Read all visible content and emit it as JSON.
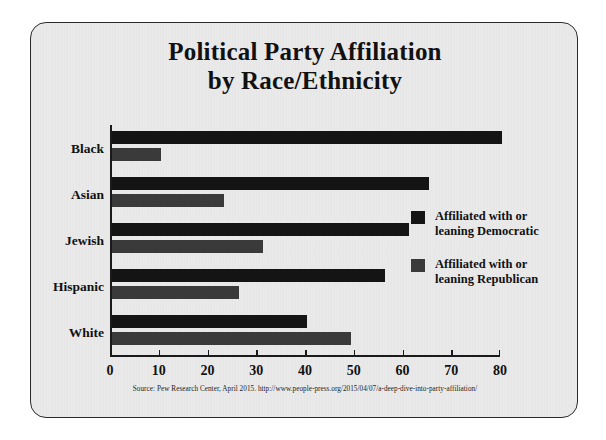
{
  "chart_data": {
    "type": "bar",
    "orientation": "horizontal",
    "title": "Political Party Affiliation by Race/Ethnicity",
    "title_lines": [
      "Political Party Affiliation",
      "by Race/Ethnicity"
    ],
    "categories": [
      "Black",
      "Asian",
      "Jewish",
      "Hispanic",
      "White"
    ],
    "series": [
      {
        "name": "Affiliated with or leaning Democratic",
        "name_lines": [
          "Affiliated with or",
          "leaning Democratic"
        ],
        "color": "#141414",
        "values": [
          80,
          65,
          61,
          56,
          40
        ]
      },
      {
        "name": "Affiliated with or leaning Republican",
        "name_lines": [
          "Affiliated with or",
          "leaning Republican"
        ],
        "color": "#3a3a3a",
        "values": [
          10,
          23,
          31,
          26,
          49
        ]
      }
    ],
    "xlabel": "",
    "ylabel": "",
    "xlim": [
      0,
      80
    ],
    "xticks": [
      "0",
      "10",
      "20",
      "30",
      "40",
      "50",
      "60",
      "70",
      "80"
    ],
    "grid": false,
    "legend_position": "right"
  },
  "source": {
    "text": "Source: Pew Research Center, April 2015. http://www.people-press.org/2015/04/07/a-deep-dive-into-party-affiliation/"
  },
  "style": {
    "background": "#e9e9e9",
    "page_background": "#ffffff",
    "border_color": "#2b2b2b",
    "text_color": "#111111"
  }
}
